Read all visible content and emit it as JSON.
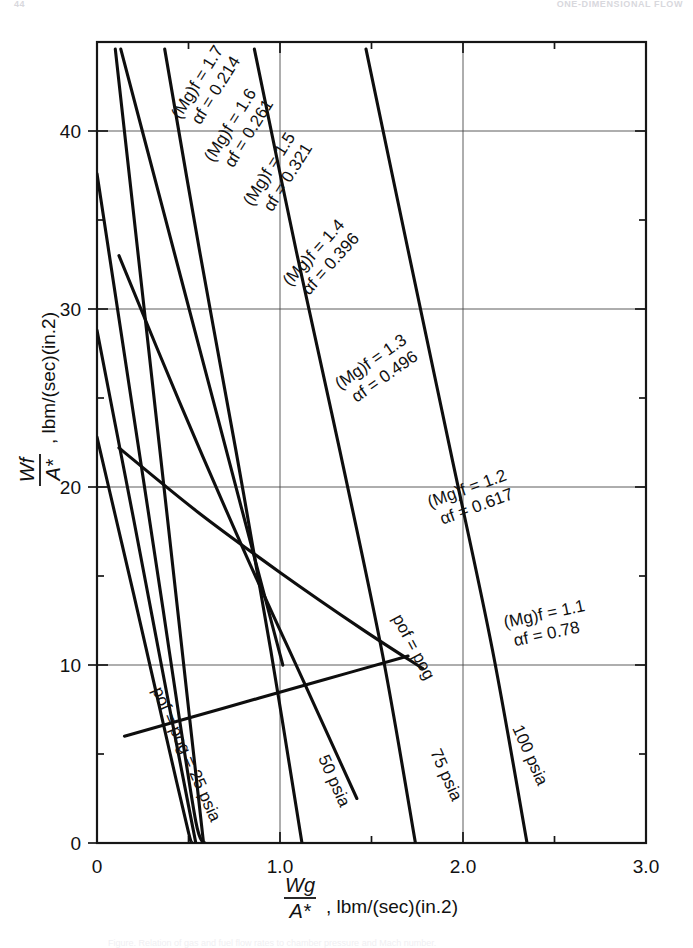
{
  "running_head": {
    "left": "44",
    "right": "ONE-DIMENSIONAL FLOW"
  },
  "footer_caption": "Figure.  Relation of gas and fuel flow rates to chamber pressure and Mach number.",
  "chart_data": {
    "type": "line",
    "title": "",
    "xlabel": "Wg / A*, lbm/(sec)(in.2)",
    "ylabel": "Wf / A*, lbm/(sec)(in.2)",
    "xlim": [
      0,
      3.0
    ],
    "ylim": [
      0,
      45
    ],
    "grid": true,
    "legend": "inline-labels",
    "x_ticks_major": [
      "0",
      "1.0",
      "2.0",
      "3.0"
    ],
    "x_tick_values": [
      0,
      1.0,
      2.0,
      3.0
    ],
    "x_ticks_minor": [
      0.5,
      1.5,
      2.5
    ],
    "y_ticks_major": [
      "0",
      "10",
      "20",
      "30",
      "40"
    ],
    "y_tick_values": [
      0,
      10,
      20,
      30,
      40
    ],
    "y_ticks_minor": [
      5,
      15,
      25,
      35,
      45
    ],
    "axis_symbols": {
      "y_num": "W",
      "y_num_sub": "f",
      "y_den": "A",
      "y_den_sup": "*",
      "x_num": "W",
      "x_num_sub": "g",
      "x_den": "A",
      "x_den_sup": "*",
      "units": ", lb",
      "units_sub": "m",
      "units_tail": "/(sec)(in.",
      "units_sup": "2",
      "units_close": ")"
    },
    "series": [
      {
        "name": "Mg_f_1.7",
        "kind": "mach",
        "label_line1": "(Mg)f = 1.7",
        "label_line2": "αf = 0.214",
        "mach": 1.7,
        "alpha": 0.214,
        "points": [
          [
            0.0,
            37.6
          ],
          [
            0.09,
            31.5
          ],
          [
            0.18,
            25.4
          ],
          [
            0.27,
            19.3
          ],
          [
            0.36,
            13.2
          ],
          [
            0.45,
            7.0
          ],
          [
            0.54,
            1.2
          ],
          [
            0.58,
            0.0
          ]
        ]
      },
      {
        "name": "Mg_f_1.6",
        "kind": "mach",
        "label_line1": "(Mg)f = 1.6",
        "label_line2": "αf = 0.261",
        "mach": 1.6,
        "alpha": 0.261,
        "points": [
          [
            0.0,
            28.8
          ],
          [
            0.1,
            23.5
          ],
          [
            0.2,
            18.2
          ],
          [
            0.3,
            12.8
          ],
          [
            0.4,
            7.4
          ],
          [
            0.5,
            2.1
          ],
          [
            0.54,
            0.0
          ]
        ]
      },
      {
        "name": "Mg_f_1.5",
        "kind": "mach",
        "label_line1": "(Mg)f = 1.5",
        "label_line2": "αf = 0.321",
        "mach": 1.5,
        "alpha": 0.321,
        "points": [
          [
            0.0,
            22.8
          ],
          [
            0.1,
            18.4
          ],
          [
            0.2,
            14.0
          ],
          [
            0.3,
            9.5
          ],
          [
            0.4,
            5.0
          ],
          [
            0.5,
            0.6
          ],
          [
            0.52,
            0.0
          ]
        ]
      },
      {
        "name": "Mg_f_1.4",
        "kind": "mach",
        "label_line1": "(Mg)f = 1.4",
        "label_line2": "αf = 0.396",
        "mach": 1.4,
        "alpha": 0.396,
        "points": [
          [
            0.13,
            44.6
          ],
          [
            0.35,
            36.0
          ],
          [
            0.57,
            27.4
          ],
          [
            0.79,
            18.8
          ],
          [
            1.0,
            10.6
          ],
          [
            1.0,
            10.6
          ]
        ]
      },
      {
        "name": "Mg_f_1.3",
        "kind": "mach",
        "label_line1": "(Mg)f = 1.3",
        "label_line2": "αf = 0.496",
        "mach": 1.3,
        "alpha": 0.496,
        "points": [
          [
            0.12,
            33.0
          ],
          [
            0.45,
            24.8
          ],
          [
            0.8,
            16.5
          ],
          [
            1.15,
            8.6
          ],
          [
            1.42,
            2.5
          ]
        ]
      },
      {
        "name": "Mg_f_1.2",
        "kind": "mach",
        "label_line1": "(Mg)f = 1.2",
        "label_line2": "αf = 0.617",
        "mach": 1.2,
        "alpha": 0.617,
        "points": [
          [
            0.12,
            22.2
          ],
          [
            0.55,
            18.6
          ],
          [
            1.0,
            15.2
          ],
          [
            1.45,
            12.0
          ],
          [
            1.78,
            9.8
          ]
        ]
      },
      {
        "name": "Mg_f_1.1",
        "kind": "mach",
        "label_line1": "(Mg)f = 1.1",
        "label_line2": "αf = 0.78",
        "mach": 1.1,
        "alpha": 0.78,
        "points": [
          [
            0.15,
            6.0
          ],
          [
            0.7,
            7.6
          ],
          [
            1.25,
            9.2
          ],
          [
            1.7,
            10.5
          ]
        ]
      },
      {
        "name": "p_25_psia",
        "kind": "pressure",
        "label": "pof = pog = 25 psia",
        "pressure": 25,
        "points": [
          [
            0.1,
            44.6
          ],
          [
            0.22,
            33.5
          ],
          [
            0.34,
            22.4
          ],
          [
            0.46,
            11.3
          ],
          [
            0.58,
            0.2
          ],
          [
            0.59,
            0.0
          ]
        ]
      },
      {
        "name": "p_50_psia",
        "kind": "pressure",
        "label": "50 psia",
        "pressure": 50,
        "points": [
          [
            0.37,
            44.6
          ],
          [
            0.56,
            33.3
          ],
          [
            0.76,
            22.0
          ],
          [
            0.95,
            10.8
          ],
          [
            1.12,
            0.0
          ]
        ]
      },
      {
        "name": "p_75_psia",
        "kind": "pressure",
        "label": "75 psia",
        "pressure": 75,
        "points": [
          [
            0.86,
            44.6
          ],
          [
            1.09,
            33.2
          ],
          [
            1.33,
            21.9
          ],
          [
            1.56,
            10.6
          ],
          [
            1.74,
            0.0
          ]
        ]
      },
      {
        "name": "p_100_psia",
        "kind": "pressure",
        "label": "pof = pog = 100 psia",
        "pressure": 100,
        "points": [
          [
            1.47,
            44.6
          ],
          [
            1.7,
            33.3
          ],
          [
            1.93,
            22.1
          ],
          [
            2.16,
            10.9
          ],
          [
            2.35,
            0.0
          ]
        ]
      }
    ],
    "inline_labels": [
      {
        "id": "lbl-mach-17",
        "l1": "(Mg)f = 1.7",
        "l2": "αf = 0.214",
        "x": 180,
        "y": 120,
        "rot": -58
      },
      {
        "id": "lbl-mach-16",
        "l1": "(Mg)f = 1.6",
        "l2": "αf = 0.261",
        "x": 213,
        "y": 163,
        "rot": -58
      },
      {
        "id": "lbl-mach-15",
        "l1": "(Mg)f = 1.5",
        "l2": "αf = 0.321",
        "x": 252,
        "y": 207,
        "rot": -58
      },
      {
        "id": "lbl-mach-14",
        "l1": "(Mg)f = 1.4",
        "l2": "αf = 0.396",
        "x": 290,
        "y": 287,
        "rot": -48
      },
      {
        "id": "lbl-mach-13",
        "l1": "(Mg)f = 1.3",
        "l2": "αf = 0.496",
        "x": 340,
        "y": 390,
        "rot": -35
      },
      {
        "id": "lbl-mach-12",
        "l1": "(Mg)f = 1.2",
        "l2": "αf = 0.617",
        "x": 430,
        "y": 508,
        "rot": -20
      },
      {
        "id": "lbl-mach-11",
        "l1": "(Mg)f = 1.1",
        "l2": "αf = 0.78",
        "x": 505,
        "y": 628,
        "rot": -12
      },
      {
        "id": "lbl-p25",
        "l1": "pof = pog = 25 psia",
        "x": 152,
        "y": 690,
        "rot": 66
      },
      {
        "id": "lbl-p50",
        "l1": "50 psia",
        "x": 318,
        "y": 758,
        "rot": 66
      },
      {
        "id": "lbl-p75",
        "l1": "75 psia",
        "x": 430,
        "y": 752,
        "rot": 66
      },
      {
        "id": "lbl-p100",
        "l1": "100 psia",
        "x": 512,
        "y": 728,
        "rot": 66
      },
      {
        "id": "lbl-p100-top",
        "l1": "pof = pog",
        "x": 392,
        "y": 618,
        "rot": 62
      }
    ]
  }
}
